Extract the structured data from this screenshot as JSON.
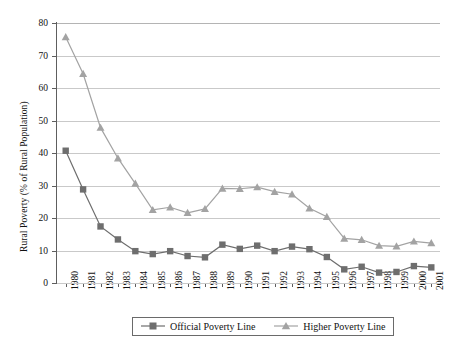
{
  "chart_data": {
    "type": "line",
    "title": "",
    "xlabel": "",
    "ylabel": "Rural Poverty (% of Rural Population)",
    "ylim": [
      0,
      80
    ],
    "yticks": [
      0,
      10,
      20,
      30,
      40,
      50,
      60,
      70,
      80
    ],
    "grid": true,
    "legend_position": "bottom",
    "categories": [
      "1980",
      "1981",
      "1982",
      "1983",
      "1984",
      "1985",
      "1986",
      "1987",
      "1988",
      "1989",
      "1990",
      "1991",
      "1992",
      "1993",
      "1994",
      "1995",
      "1996",
      "1997",
      "1998",
      "1999",
      "2000",
      "2001"
    ],
    "series": [
      {
        "name": "Official Poverty Line",
        "marker": "square",
        "color": "#6e6e6e",
        "values": [
          40.7,
          28.8,
          17.4,
          13.4,
          9.8,
          8.9,
          9.8,
          8.3,
          7.9,
          11.8,
          10.5,
          11.5,
          9.8,
          11.2,
          10.4,
          8.0,
          4.2,
          5.0,
          3.2,
          3.4,
          5.2,
          4.8
        ]
      },
      {
        "name": "Higher Poverty Line",
        "marker": "triangle",
        "color": "#a3a3a3",
        "values": [
          75.7,
          64.4,
          47.8,
          38.4,
          30.6,
          22.5,
          23.3,
          21.6,
          22.8,
          29.1,
          29.0,
          29.5,
          28.1,
          27.3,
          23.0,
          20.4,
          13.7,
          13.3,
          11.5,
          11.3,
          12.8,
          12.3
        ]
      }
    ]
  },
  "legend": {
    "entries": [
      {
        "label": "Official Poverty Line",
        "marker_icon": "square-marker-icon"
      },
      {
        "label": "Higher Poverty Line",
        "marker_icon": "triangle-marker-icon"
      }
    ]
  },
  "colors": {
    "official": "#6e6e6e",
    "higher": "#a3a3a3",
    "grid": "#c9c9c9",
    "axis": "#5e5e5e",
    "text": "#111111"
  }
}
